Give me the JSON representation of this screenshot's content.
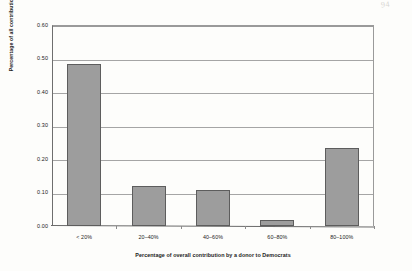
{
  "page": {
    "artifact_text": "94"
  },
  "chart_data": {
    "type": "bar",
    "title": "",
    "xlabel": "Percentage of overall contribution by a donor to Democrats",
    "ylabel": "Percentage of all contributions",
    "categories": [
      "< 20%",
      "20–40%",
      "40–60%",
      "60–80%",
      "80–100%"
    ],
    "values": [
      0.485,
      0.12,
      0.107,
      0.019,
      0.234
    ],
    "ylim": [
      0.0,
      0.6
    ],
    "yticks": [
      "0.00",
      "0.10",
      "0.20",
      "0.30",
      "0.40",
      "0.50",
      "0.60"
    ],
    "ytick_values": [
      0.0,
      0.1,
      0.2,
      0.3,
      0.4,
      0.5,
      0.6
    ],
    "grid": "horizontal",
    "legend": "none",
    "bar_color": "#9d9d9d",
    "bar_border_color": "#5d5d5d",
    "axis_color": "#6a6a6a",
    "gridline_color": "#a5a5a5"
  }
}
